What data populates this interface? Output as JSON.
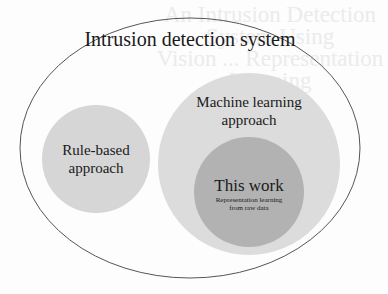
{
  "background_bleed": {
    "title": "An Intrusion Detection System Using Vision ... Representation Learning",
    "title_lines": [
      "An Intrusion Detection System Using",
      "Vision ... Representation",
      "Learning"
    ]
  },
  "diagram": {
    "outer": {
      "label": "Intrusion detection system",
      "shape": "ellipse",
      "fill": "#fdfdfd",
      "stroke": "#555555"
    },
    "rule_based": {
      "label_line1": "Rule-based",
      "label_line2": "approach",
      "fill": "#d6d6d6"
    },
    "machine_learning": {
      "label_line1": "Machine learning",
      "label_line2": "approach",
      "fill": "#dcdcdc"
    },
    "this_work": {
      "label": "This work",
      "sub_line1": "Representation learning",
      "sub_line2": "from raw data",
      "fill": "#b2b2b2"
    }
  }
}
